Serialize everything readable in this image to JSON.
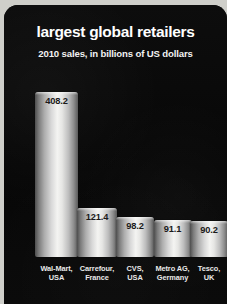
{
  "chart_data": {
    "type": "bar",
    "title": "largest global retailers",
    "subtitle": "2010 sales, in billions of US dollars",
    "xlabel": "",
    "ylabel": "",
    "ylim": [
      0,
      430
    ],
    "grid": false,
    "legend": false,
    "categories": [
      "Wal-Mart, USA",
      "Carrefour, France",
      "CVS, USA",
      "Metro AG, Germany",
      "Tesco, UK"
    ],
    "values": [
      408.2,
      121.4,
      98.2,
      91.1,
      90.2
    ],
    "points": [
      {
        "company": "Wal-Mart",
        "country": "USA",
        "value": 408.2,
        "value_label": "408.2"
      },
      {
        "company": "Carrefour",
        "country": "France",
        "value": 121.4,
        "value_label": "121.4"
      },
      {
        "company": "CVS",
        "country": "USA",
        "value": 98.2,
        "value_label": "98.2"
      },
      {
        "company": "Metro AG",
        "country": "Germany",
        "value": 91.1,
        "value_label": "91.1"
      },
      {
        "company": "Tesco",
        "country": "UK",
        "value": 90.2,
        "value_label": "90.2"
      }
    ]
  },
  "colors": {
    "background": "#090909",
    "title_text": "#ffffff",
    "subtitle_text": "#f2f2f2",
    "value_text": "#1a1a1a",
    "category_text": "#e9e9e9",
    "bar_highlight": "#f4f4f2",
    "bar_shadow": "#4e4e4e"
  }
}
